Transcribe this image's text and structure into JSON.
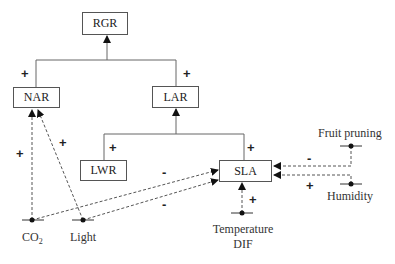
{
  "diagram": {
    "type": "causal-influence-diagram",
    "nodes": {
      "rgr": "RGR",
      "nar": "NAR",
      "lar": "LAR",
      "lwr": "LWR",
      "sla": "SLA"
    },
    "factors": {
      "co2_main": "CO",
      "co2_sub": "2",
      "light": "Light",
      "fruit_pruning": "Fruit pruning",
      "humidity": "Humidity",
      "temperature": "Temperature",
      "dif": "DIF"
    },
    "signs": {
      "nar_to_rgr": "+",
      "lar_to_rgr": "+",
      "lwr_to_lar": "+",
      "sla_to_lar": "+",
      "co2_to_nar": "+",
      "light_to_nar": "+",
      "co2_to_sla": "-",
      "light_to_sla": "-",
      "fruit_pruning_to_sla": "-",
      "humidity_to_sla": "+",
      "temperature_to_sla": "+"
    },
    "edges": [
      {
        "from": "NAR",
        "to": "RGR",
        "sign": "+",
        "style": "solid"
      },
      {
        "from": "LAR",
        "to": "RGR",
        "sign": "+",
        "style": "solid"
      },
      {
        "from": "LWR",
        "to": "LAR",
        "sign": "+",
        "style": "solid"
      },
      {
        "from": "SLA",
        "to": "LAR",
        "sign": "+",
        "style": "solid"
      },
      {
        "from": "CO2",
        "to": "NAR",
        "sign": "+",
        "style": "dashed"
      },
      {
        "from": "Light",
        "to": "NAR",
        "sign": "+",
        "style": "dashed"
      },
      {
        "from": "CO2",
        "to": "SLA",
        "sign": "-",
        "style": "dashed"
      },
      {
        "from": "Light",
        "to": "SLA",
        "sign": "-",
        "style": "dashed"
      },
      {
        "from": "Fruit pruning",
        "to": "SLA",
        "sign": "-",
        "style": "dashed"
      },
      {
        "from": "Humidity",
        "to": "SLA",
        "sign": "+",
        "style": "dashed"
      },
      {
        "from": "Temperature DIF",
        "to": "SLA",
        "sign": "+",
        "style": "dashed"
      }
    ]
  }
}
